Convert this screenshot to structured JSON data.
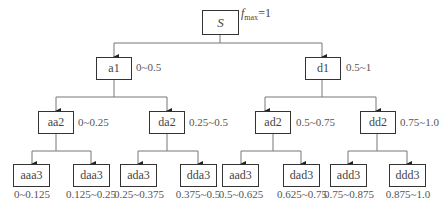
{
  "diagram": {
    "type": "binary-tree",
    "root": {
      "label": "S",
      "annotation_symbol": "f",
      "annotation_sub": "max",
      "annotation_value": "=1"
    },
    "level1": [
      {
        "label": "a1",
        "range": "0~0.5"
      },
      {
        "label": "d1",
        "range": "0.5~1"
      }
    ],
    "level2": [
      {
        "label": "aa2",
        "range": "0~0.25"
      },
      {
        "label": "da2",
        "range": "0.25~0.5"
      },
      {
        "label": "ad2",
        "range": "0.5~0.75"
      },
      {
        "label": "dd2",
        "range": "0.75~1.0"
      }
    ],
    "level3": [
      {
        "label": "aaa3",
        "range": "0~0.125"
      },
      {
        "label": "daa3",
        "range": "0.125~0.25"
      },
      {
        "label": "ada3",
        "range": "0.25~0.375"
      },
      {
        "label": "dda3",
        "range": "0.375~0.5"
      },
      {
        "label": "aad3",
        "range": "0.5~0.625"
      },
      {
        "label": "dad3",
        "range": "0.625~0.75"
      },
      {
        "label": "add3",
        "range": "0.75~0.875"
      },
      {
        "label": "ddd3",
        "range": "0.875~1.0"
      }
    ],
    "colors": {
      "line": "#666666",
      "box_border": "#333333",
      "text": "#444444"
    }
  }
}
